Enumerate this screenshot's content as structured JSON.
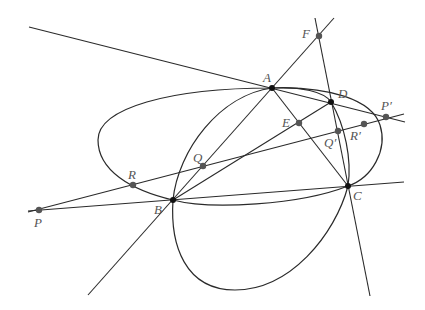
{
  "diagram": {
    "type": "projective-geometry-figure",
    "points": [
      {
        "id": "A",
        "label": "A",
        "x": 272,
        "y": 88
      },
      {
        "id": "B",
        "label": "B",
        "x": 173,
        "y": 200
      },
      {
        "id": "C",
        "label": "C",
        "x": 348,
        "y": 186
      },
      {
        "id": "D",
        "label": "D",
        "x": 331,
        "y": 102
      },
      {
        "id": "E",
        "label": "E",
        "x": 299,
        "y": 123
      },
      {
        "id": "F",
        "label": "F",
        "x": 319,
        "y": 36
      },
      {
        "id": "P",
        "label": "P",
        "x": 39,
        "y": 210
      },
      {
        "id": "P_prime",
        "label": "P′",
        "x": 386,
        "y": 117
      },
      {
        "id": "Q",
        "label": "Q",
        "x": 203,
        "y": 166
      },
      {
        "id": "Q_prime",
        "label": "Q′",
        "x": 338,
        "y": 131
      },
      {
        "id": "R",
        "label": "R",
        "x": 133,
        "y": 185
      },
      {
        "id": "R_prime",
        "label": "R′",
        "x": 364,
        "y": 124
      }
    ],
    "labels": {
      "A": "A",
      "B": "B",
      "C": "C",
      "D": "D",
      "E": "E",
      "F": "F",
      "P": "P",
      "P_prime": "P′",
      "Q": "Q",
      "Q_prime": "Q′",
      "R": "R",
      "R_prime": "R′"
    },
    "lines": [
      {
        "name": "tangent-line-through-A-D",
        "from": "P′ side",
        "to": "upper-left"
      },
      {
        "name": "line-A-B-F",
        "through": [
          "A",
          "B",
          "F"
        ]
      },
      {
        "name": "line-F-D-C",
        "through": [
          "F",
          "D",
          "C"
        ]
      },
      {
        "name": "line-P-B-C",
        "through": [
          "P",
          "B",
          "C"
        ]
      },
      {
        "name": "line-P-R-Q-Q′-R′",
        "through": [
          "P",
          "R",
          "Q",
          "Q′",
          "R′"
        ]
      },
      {
        "name": "line-B-E-D",
        "through": [
          "B",
          "E",
          "D"
        ]
      },
      {
        "name": "line-A-E-C",
        "through": [
          "A",
          "E",
          "C"
        ]
      }
    ],
    "conics": [
      {
        "name": "horizontal-ellipse",
        "through": [
          "A",
          "B",
          "C",
          "D"
        ]
      },
      {
        "name": "vertical-conic",
        "through": [
          "A",
          "B",
          "C",
          "D"
        ]
      }
    ],
    "colors": {
      "stroke": "#2a2a2a",
      "point": "#555555",
      "label": "#555555",
      "background": "#ffffff"
    }
  }
}
